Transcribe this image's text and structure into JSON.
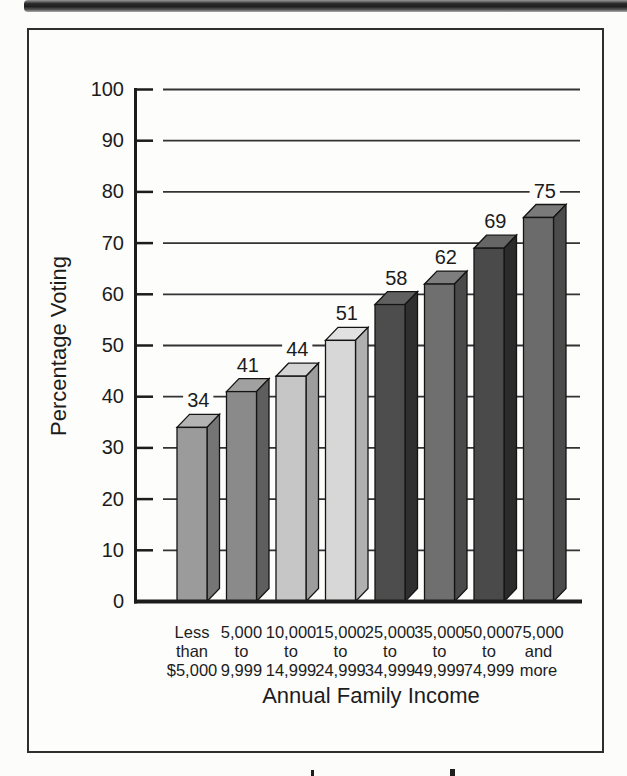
{
  "chart_data": {
    "type": "bar",
    "title": "",
    "xlabel": "Annual Family Income",
    "ylabel": "Percentage Voting",
    "categories": [
      [
        "Less",
        "than",
        "$5,000"
      ],
      [
        "5,000",
        "to",
        "9,999"
      ],
      [
        "10,000",
        "to",
        "14,999"
      ],
      [
        "15,000",
        "to",
        "24,999"
      ],
      [
        "25,000",
        "to",
        "34,999"
      ],
      [
        "35,000",
        "to",
        "49,999"
      ],
      [
        "50,000",
        "to",
        "74,999"
      ],
      [
        "75,000",
        "and",
        "more"
      ]
    ],
    "values": [
      34,
      41,
      44,
      51,
      58,
      62,
      69,
      75
    ],
    "ylim": [
      0,
      100
    ],
    "ytick_step": 10,
    "grid": true,
    "legend": "none",
    "bar_styles": [
      {
        "face": "#9b9b9b",
        "top": "#b3b3b3",
        "side": "#757575"
      },
      {
        "face": "#8a8a8a",
        "top": "#a1a1a1",
        "side": "#5e5e5e"
      },
      {
        "face": "#c6c6c6",
        "top": "#d4d4d4",
        "side": "#9d9d9d"
      },
      {
        "face": "#d7d7d7",
        "top": "#e1e1e1",
        "side": "#b0b0b0"
      },
      {
        "face": "#4d4d4d",
        "top": "#606060",
        "side": "#2f2f2f"
      },
      {
        "face": "#6f6f6f",
        "top": "#7e7e7e",
        "side": "#4a4a4a"
      },
      {
        "face": "#4a4a4a",
        "top": "#666666",
        "side": "#2b2b2b"
      },
      {
        "face": "#6b6b6b",
        "top": "#7a7a7a",
        "side": "#4b4b4b"
      }
    ],
    "ink_color": "#1c1c1c",
    "grid_color": "#333333"
  }
}
